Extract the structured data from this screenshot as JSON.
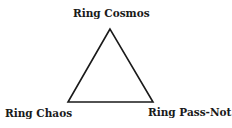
{
  "diagram": {
    "shape": "triangle",
    "stroke_color": "#1a1a1a",
    "vertices": {
      "top": {
        "label": "Ring Cosmos"
      },
      "bottom_left": {
        "label": "Ring Chaos"
      },
      "bottom_right": {
        "label": "Ring Pass-Not"
      }
    }
  }
}
